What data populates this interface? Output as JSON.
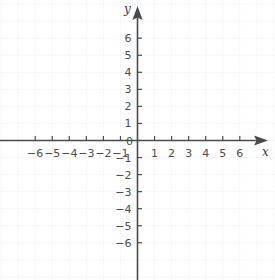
{
  "chart_data": {
    "type": "scatter",
    "title": "",
    "xlabel": "x",
    "ylabel": "y",
    "xlim": [
      -7.5,
      7.5
    ],
    "ylim": [
      -7.5,
      7.5
    ],
    "x_tick_labels": [
      "-6",
      "-5",
      "-4",
      "-3",
      "-2",
      "-1",
      "1",
      "2",
      "3",
      "4",
      "5",
      "6"
    ],
    "x_tick_values": [
      -6,
      -5,
      -4,
      -3,
      -2,
      -1,
      1,
      2,
      3,
      4,
      5,
      6
    ],
    "y_tick_labels": [
      "6",
      "5",
      "4",
      "3",
      "2",
      "1",
      "-1",
      "-2",
      "-3",
      "-4",
      "-5",
      "-6"
    ],
    "y_tick_values": [
      6,
      5,
      4,
      3,
      2,
      1,
      -1,
      -2,
      -3,
      -4,
      -5,
      -6
    ],
    "origin_label": "0",
    "grid": true,
    "legend": null,
    "series": [],
    "annotations": []
  },
  "axes": {
    "x_name": "x",
    "y_name": "y",
    "origin_label": "0"
  },
  "colors": {
    "background": "#ffffff",
    "axis": "#4a4a4a",
    "grid": "#f7f7f7",
    "tick_text": "#4d4d4d",
    "axis_name": "#3d3d3d"
  }
}
